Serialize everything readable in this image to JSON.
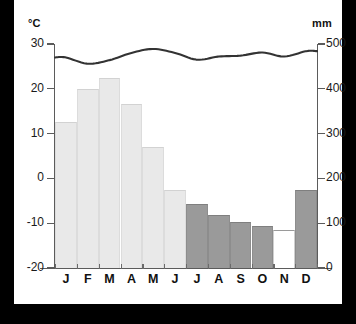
{
  "axes": {
    "left_unit": "°C",
    "right_unit": "mm",
    "left_ticks": [
      "30",
      "20",
      "10",
      "0",
      "-10",
      "-20"
    ],
    "right_ticks": [
      "500",
      "400",
      "300",
      "200",
      "100",
      "0"
    ]
  },
  "months": [
    "J",
    "F",
    "M",
    "A",
    "M",
    "J",
    "J",
    "A",
    "S",
    "O",
    "N",
    "D"
  ],
  "colors": {
    "bar_light": "#e9e9e9",
    "bar_mid": "#9a9a9a",
    "bar_empty": "#ffffff",
    "line": "#333333",
    "axis": "#5b5b5b",
    "background": "#ffffff",
    "frame": "#000000"
  },
  "chart_data": {
    "type": "bar",
    "title": "",
    "subtitle": "",
    "xlabel": "",
    "ylabel": "°C",
    "y2label": "mm",
    "categories": [
      "J",
      "F",
      "M",
      "A",
      "M",
      "J",
      "J",
      "A",
      "S",
      "O",
      "N",
      "D"
    ],
    "ylim": [
      -20,
      30
    ],
    "y2lim": [
      0,
      500
    ],
    "ytick_values": [
      30,
      20,
      10,
      0,
      -10,
      -20
    ],
    "y2tick_values": [
      500,
      400,
      300,
      200,
      100,
      0
    ],
    "grid": false,
    "legend": "none",
    "series": [
      {
        "name": "Precipitation",
        "unit": "mm",
        "axis": "right",
        "render": "bar",
        "values": [
          326,
          400,
          424,
          366,
          270,
          174,
          143,
          118,
          103,
          94,
          85,
          174
        ],
        "bar_styles": [
          "light",
          "light",
          "light",
          "light",
          "light",
          "light",
          "mid",
          "mid",
          "mid",
          "mid",
          "empty",
          "mid"
        ]
      },
      {
        "name": "Temperature",
        "unit": "°C",
        "axis": "left",
        "render": "line",
        "values": [
          27.0,
          25.6,
          26.4,
          28.0,
          28.9,
          28.0,
          26.5,
          27.2,
          27.4,
          28.1,
          27.2,
          28.4
        ]
      }
    ]
  }
}
